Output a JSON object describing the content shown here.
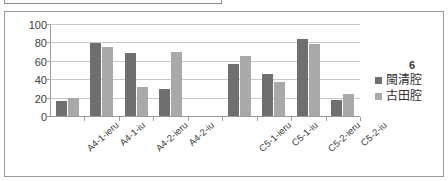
{
  "chart_data": {
    "type": "bar",
    "title": "",
    "xlabel": "",
    "ylabel": "",
    "ylim": [
      0,
      100
    ],
    "yticks": [
      0,
      20,
      40,
      60,
      80,
      100
    ],
    "grid": true,
    "legend_position": "right",
    "legend_title": "6",
    "categories": [
      "A4-1-ieru",
      "A4-1-iu",
      "A4-2-ieru",
      "A4-2-iu",
      "",
      "C5-1-ieru",
      "C5-1-iu",
      "C5-2-ieru",
      "C5-2-iu"
    ],
    "series": [
      {
        "name": "閩清腔",
        "color": "#706f6f",
        "values": [
          16,
          79,
          68,
          29,
          null,
          56,
          46,
          84,
          17
        ]
      },
      {
        "name": "古田腔",
        "color": "#aaa9a9",
        "values": [
          20,
          75,
          31,
          70,
          null,
          65,
          37,
          78,
          24
        ]
      }
    ]
  },
  "colors": {
    "series_dark": "#706f6f",
    "series_light": "#aaa9a9",
    "gridline": "#c8c8c8",
    "axis": "#9b9b9b",
    "frame_border": "#9a9a9a"
  }
}
